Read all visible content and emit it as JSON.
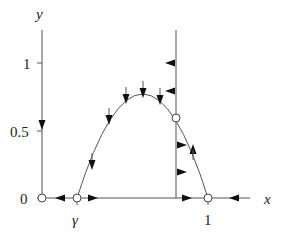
{
  "diagram": {
    "type": "phase-portrait",
    "axes": {
      "x_label": "x",
      "y_label": "y",
      "y_ticks": [
        {
          "label": "1",
          "value": 1
        },
        {
          "label": "0.5",
          "value": 0.5
        },
        {
          "label": "0",
          "value": 0
        }
      ],
      "x_ticks": [
        {
          "label": "γ",
          "value": "gamma"
        },
        {
          "label": "1",
          "value": 1
        }
      ]
    },
    "equilibria": [
      {
        "name": "origin",
        "x": 0,
        "y": 0
      },
      {
        "name": "gamma",
        "x": "γ",
        "y": 0
      },
      {
        "name": "one",
        "x": 1,
        "y": 0
      },
      {
        "name": "interior",
        "x": "x*",
        "y": "y*"
      }
    ],
    "nullclines": [
      {
        "name": "y-axis",
        "description": "vertical nullcline x=0, arrows pointing down"
      },
      {
        "name": "x-axis",
        "description": "horizontal nullcline y=0, arrows toward 0 and 1 from γ"
      },
      {
        "name": "vertical-nullcline",
        "description": "vertical line through interior equilibrium, arrows left above, right below"
      },
      {
        "name": "parabola-nullcline",
        "description": "hump from γ to 1, arrows down on left, up on right"
      }
    ],
    "colors": {
      "line": "#555555",
      "arrow": "#111111",
      "text": "#222222"
    }
  }
}
